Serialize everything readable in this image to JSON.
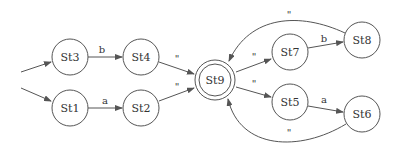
{
  "diagram": {
    "type": "finite-state-automaton",
    "colors": {
      "stroke": "#555555",
      "text": "#333333",
      "background": "#ffffff"
    },
    "nodes": [
      {
        "id": "St1",
        "label": "St1",
        "x": 70,
        "y": 108,
        "accepting": false
      },
      {
        "id": "St2",
        "label": "St2",
        "x": 141,
        "y": 108,
        "accepting": false
      },
      {
        "id": "St3",
        "label": "St3",
        "x": 70,
        "y": 57,
        "accepting": false
      },
      {
        "id": "St4",
        "label": "St4",
        "x": 141,
        "y": 57,
        "accepting": false
      },
      {
        "id": "St5",
        "label": "St5",
        "x": 290,
        "y": 102,
        "accepting": false
      },
      {
        "id": "St6",
        "label": "St6",
        "x": 362,
        "y": 114,
        "accepting": false
      },
      {
        "id": "St7",
        "label": "St7",
        "x": 290,
        "y": 52,
        "accepting": false
      },
      {
        "id": "St8",
        "label": "St8",
        "x": 362,
        "y": 40,
        "accepting": false
      },
      {
        "id": "St9",
        "label": "St9",
        "x": 215,
        "y": 80,
        "accepting": true
      }
    ],
    "start_edges": [
      {
        "to": "St3",
        "label": ""
      },
      {
        "to": "St1",
        "label": ""
      }
    ],
    "edges": [
      {
        "from": "St3",
        "to": "St4",
        "label": "b"
      },
      {
        "from": "St1",
        "to": "St2",
        "label": "a"
      },
      {
        "from": "St4",
        "to": "St9",
        "label": "\""
      },
      {
        "from": "St2",
        "to": "St9",
        "label": "\""
      },
      {
        "from": "St9",
        "to": "St7",
        "label": "\""
      },
      {
        "from": "St9",
        "to": "St5",
        "label": "\""
      },
      {
        "from": "St7",
        "to": "St8",
        "label": "b"
      },
      {
        "from": "St5",
        "to": "St6",
        "label": "a"
      },
      {
        "from": "St8",
        "to": "St9",
        "label": "\""
      },
      {
        "from": "St6",
        "to": "St9",
        "label": "\""
      }
    ]
  }
}
